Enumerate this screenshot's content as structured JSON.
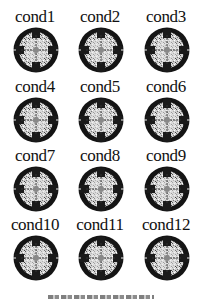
{
  "figure": {
    "type": "scalp-topography-grid",
    "rows": 4,
    "cols": 3,
    "panels": [
      {
        "label": "cond1"
      },
      {
        "label": "cond2"
      },
      {
        "label": "cond3"
      },
      {
        "label": "cond4"
      },
      {
        "label": "cond5"
      },
      {
        "label": "cond6"
      },
      {
        "label": "cond7"
      },
      {
        "label": "cond8"
      },
      {
        "label": "cond9"
      },
      {
        "label": "cond10"
      },
      {
        "label": "cond11"
      },
      {
        "label": "cond12"
      }
    ],
    "caption": "",
    "colors": {
      "map_dark": "#111111",
      "map_light": "#e8e8e8",
      "background": "#ffffff"
    }
  }
}
